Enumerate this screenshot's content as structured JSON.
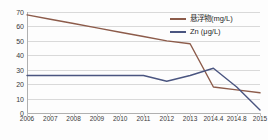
{
  "chart_data": {
    "type": "line",
    "title": "",
    "xlabel": "",
    "ylabel": "",
    "categories": [
      "2006",
      "2007",
      "2008",
      "2009",
      "2010",
      "2011",
      "2012",
      "2013",
      "2014.4",
      "2014.8",
      "2015"
    ],
    "yticks": [
      0,
      10,
      20,
      30,
      40,
      50,
      60,
      70
    ],
    "ylim": [
      0,
      70
    ],
    "grid": true,
    "legend_position": "top-right",
    "series": [
      {
        "name": "悬浮物(mg/L)",
        "color": "#8c5b4a",
        "values": [
          68,
          65,
          62,
          59,
          56,
          53,
          50,
          48,
          18,
          16,
          14
        ]
      },
      {
        "name": "Zn (μg/L)",
        "color": "#4a5580",
        "values": [
          26,
          26,
          26,
          26,
          26,
          26,
          22,
          26,
          31,
          18,
          2
        ]
      }
    ]
  },
  "legend": {
    "items": [
      {
        "label": "悬浮物(mg/L)",
        "color": "#8c5b4a"
      },
      {
        "label": "Zn (μg/L)",
        "color": "#4a5580"
      }
    ]
  }
}
